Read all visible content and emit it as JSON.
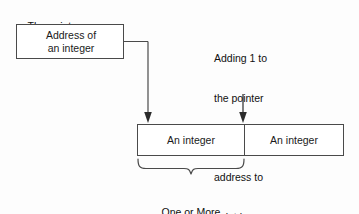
{
  "diagram": {
    "title_caption": {
      "prefix": "The pointer ",
      "variable": "p"
    },
    "pointer_box": {
      "line1": "Address of",
      "line2": "an integer"
    },
    "annotation": {
      "line1": "Adding 1 to",
      "line2": "the pointer",
      "line3": "increases the",
      "line4": "address to",
      "line5": "point here"
    },
    "memory": {
      "cells": [
        {
          "label": "An integer"
        },
        {
          "label": "An integer"
        }
      ]
    },
    "brace_caption": {
      "line1": "One or More",
      "line2": "bytes"
    },
    "colors": {
      "background": "#fdfdfd",
      "stroke": "#4a4a4a",
      "arrow": "#2b2b2b",
      "text": "#111111"
    }
  }
}
